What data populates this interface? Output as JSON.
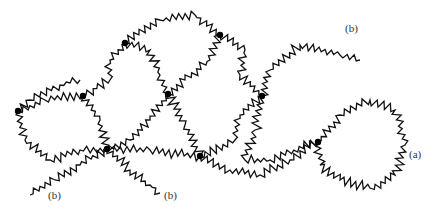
{
  "diagram": {
    "type": "polymer-network",
    "labels": [
      {
        "text": "(b)",
        "x": 345,
        "y": 30
      },
      {
        "text": "(a)",
        "x": 409,
        "y": 156
      },
      {
        "text": "(b)",
        "x": 48,
        "y": 197
      },
      {
        "text": "(b)",
        "x": 164,
        "y": 197
      }
    ],
    "nodes": [
      {
        "id": "n1",
        "x": 18,
        "y": 111
      },
      {
        "id": "n2",
        "x": 83,
        "y": 96
      },
      {
        "id": "n3",
        "x": 125,
        "y": 43
      },
      {
        "id": "n4",
        "x": 107,
        "y": 149
      },
      {
        "id": "n5",
        "x": 168,
        "y": 94
      },
      {
        "id": "n6",
        "x": 220,
        "y": 35
      },
      {
        "id": "n7",
        "x": 262,
        "y": 96
      },
      {
        "id": "n8",
        "x": 200,
        "y": 156
      },
      {
        "id": "n9",
        "x": 318,
        "y": 142
      }
    ],
    "colors": {
      "line": "#111111",
      "node": "#000000",
      "background": "#ffffff",
      "label": "#333333"
    }
  }
}
